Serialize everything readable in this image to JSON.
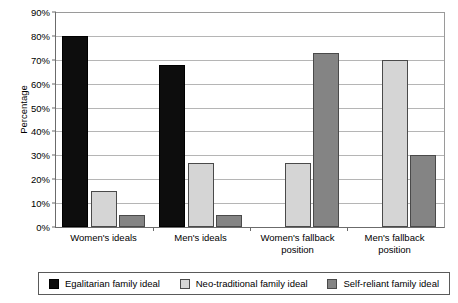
{
  "chart_data": {
    "type": "bar",
    "title": "",
    "xlabel": "",
    "ylabel": "Percentage",
    "ylim": [
      0,
      90
    ],
    "ytick_labels": [
      "90%",
      "80%",
      "70%",
      "60%",
      "50%",
      "40%",
      "30%",
      "20%",
      "10%",
      "0%"
    ],
    "ytick_values": [
      90,
      80,
      70,
      60,
      50,
      40,
      30,
      20,
      10,
      0
    ],
    "grid": true,
    "legend_position": "bottom",
    "categories": [
      "Women's ideals",
      "Men's ideals",
      "Women's fallback position",
      "Men's fallback position"
    ],
    "series": [
      {
        "name": "Egalitarian family ideal",
        "color": "#0d0d0d",
        "values": [
          80,
          68,
          null,
          null
        ]
      },
      {
        "name": "Neo-traditional family ideal",
        "color": "#d5d5d5",
        "values": [
          15,
          27,
          27,
          70
        ]
      },
      {
        "name": "Self-reliant family ideal",
        "color": "#848484",
        "values": [
          5,
          5,
          73,
          30
        ]
      }
    ]
  },
  "axis": {
    "y_title": "Percentage",
    "ticks": [
      {
        "label": "90%",
        "value": 90
      },
      {
        "label": "80%",
        "value": 80
      },
      {
        "label": "70%",
        "value": 70
      },
      {
        "label": "60%",
        "value": 60
      },
      {
        "label": "50%",
        "value": 50
      },
      {
        "label": "40%",
        "value": 40
      },
      {
        "label": "30%",
        "value": 30
      },
      {
        "label": "20%",
        "value": 20
      },
      {
        "label": "10%",
        "value": 10
      },
      {
        "label": "0%",
        "value": 0
      }
    ]
  },
  "x_labels": [
    {
      "line1": "Women's ideals",
      "line2": ""
    },
    {
      "line1": "Men's ideals",
      "line2": ""
    },
    {
      "line1": "Women's fallback",
      "line2": "position"
    },
    {
      "line1": "Men's fallback",
      "line2": "position"
    }
  ],
  "legend": {
    "items": [
      {
        "label": "Egalitarian family ideal",
        "color": "#0d0d0d"
      },
      {
        "label": "Neo-traditional family ideal",
        "color": "#d5d5d5"
      },
      {
        "label": "Self-reliant family ideal",
        "color": "#848484"
      }
    ]
  }
}
